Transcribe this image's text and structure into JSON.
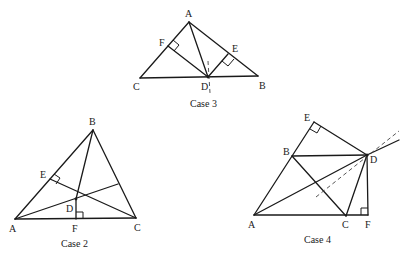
{
  "figures": [
    {
      "id": "case3",
      "caption": "Case 3",
      "points": {
        "A": [
          189,
          22
        ],
        "C": [
          140,
          78
        ],
        "D": [
          208,
          77
        ],
        "B": [
          258,
          76
        ],
        "F": [
          168,
          46
        ],
        "E": [
          228,
          54
        ]
      },
      "labels": {
        "A": "A",
        "B": "B",
        "C": "C",
        "D": "D",
        "E": "E",
        "F": "F"
      }
    },
    {
      "id": "case2",
      "caption": "Case 2",
      "points": {
        "A": [
          15,
          219
        ],
        "B": [
          93,
          130
        ],
        "C": [
          136,
          218
        ],
        "D": [
          76,
          199
        ],
        "E": [
          50,
          179
        ],
        "F": [
          76,
          219
        ],
        "G": [
          118,
          184
        ]
      },
      "labels": {
        "A": "A",
        "B": "B",
        "C": "C",
        "D": "D",
        "E": "E",
        "F": "F"
      }
    },
    {
      "id": "case4",
      "caption": "Case 4",
      "points": {
        "A": [
          254,
          215
        ],
        "B": [
          292,
          156
        ],
        "C": [
          346,
          216
        ],
        "D": [
          367,
          155
        ],
        "E": [
          314,
          122
        ],
        "F": [
          368,
          215
        ]
      },
      "labels": {
        "A": "A",
        "B": "B",
        "C": "C",
        "D": "D",
        "E": "E",
        "F": "F"
      }
    }
  ]
}
